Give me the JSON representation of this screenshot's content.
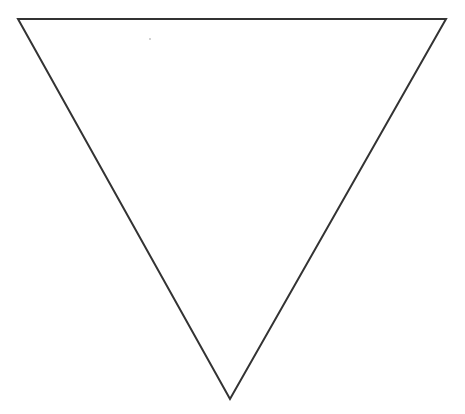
{
  "diagram": {
    "shape": "inverted-triangle",
    "canvas": {
      "width": 465,
      "height": 414,
      "background": "#ffffff"
    },
    "stroke": {
      "color": "#333333",
      "width": 2
    },
    "fill": "none",
    "vertices": [
      {
        "name": "top-left",
        "x": 18,
        "y": 19
      },
      {
        "name": "top-right",
        "x": 446,
        "y": 19
      },
      {
        "name": "bottom",
        "x": 230,
        "y": 399
      }
    ],
    "speck": {
      "x": 150,
      "y": 39,
      "r": 0.8,
      "color": "#999999"
    }
  }
}
